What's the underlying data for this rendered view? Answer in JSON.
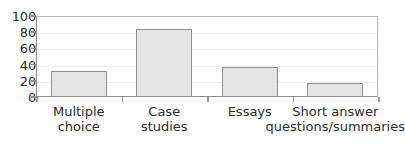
{
  "chart_data": {
    "type": "bar",
    "title": "",
    "xlabel": "",
    "ylabel": "",
    "categories": [
      "Multiple choice",
      "Case studies",
      "Essays",
      "Short answer questions/summaries"
    ],
    "category_lines": [
      [
        "Multiple",
        "choice"
      ],
      [
        "Case",
        "studies"
      ],
      [
        "Essays",
        ""
      ],
      [
        "Short answer",
        "questions/summaries"
      ]
    ],
    "values": [
      32,
      84,
      37,
      17
    ],
    "ylim": [
      0,
      100
    ],
    "yticks": [
      0,
      20,
      40,
      60,
      80,
      100
    ],
    "ytick_labels": [
      "0",
      "20",
      "40",
      "60",
      "80",
      "100"
    ],
    "grid": true,
    "legend": "none",
    "colors": {
      "bar_fill": "#e4e4e4",
      "bar_border": "#8f8f8f",
      "axis": "#8d8d8d",
      "frame": "#b9b9b9",
      "gridline": "#ededed",
      "text": "#2b2b2b",
      "background": "#ffffff"
    }
  }
}
